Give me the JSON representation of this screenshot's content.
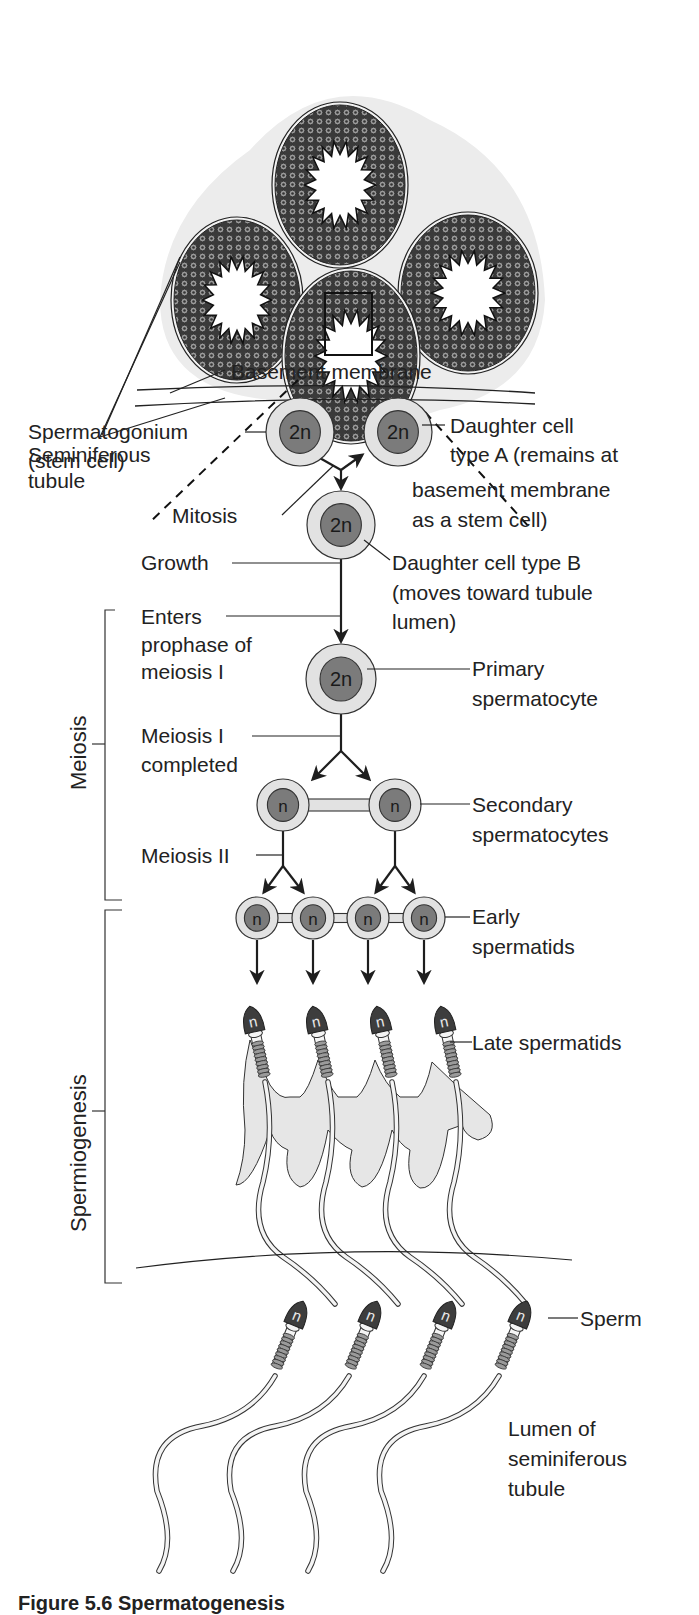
{
  "figure": {
    "caption_partial": "Figure 5.6 Spermatogenesis"
  },
  "colors": {
    "line": "#1e1e1e",
    "cell_outer": "#e2e2e2",
    "cell_nucleus": "#7b7b7b",
    "sperm_head": "#3d3d3d",
    "cytoplasm": "#e6e6e6",
    "tissue_bg": "#ececec",
    "tubule_wall": "#555555"
  },
  "tubules": {
    "label": "Seminiferous tubule",
    "label_lines": [
      "Seminiferous",
      "tubule"
    ],
    "items": [
      {
        "name": "top",
        "cx": 340,
        "cy": 185,
        "rx": 65,
        "ry": 80
      },
      {
        "name": "left",
        "cx": 237,
        "cy": 300,
        "rx": 63,
        "ry": 80
      },
      {
        "name": "right",
        "cx": 468,
        "cy": 293,
        "rx": 67,
        "ry": 78
      },
      {
        "name": "bottom",
        "cx": 351,
        "cy": 356,
        "rx": 66,
        "ry": 85
      }
    ]
  },
  "labels": {
    "basement_membrane": "Basement membrane",
    "spermatogonium": [
      "Spermatogonium",
      "(stem cell)"
    ],
    "daughter_a": [
      "Daughter cell",
      "type A (remains at",
      "basement membrane",
      "as a stem cell)"
    ],
    "mitosis": "Mitosis",
    "growth": "Growth",
    "daughter_b": [
      "Daughter cell type B",
      "(moves toward tubule",
      "lumen)"
    ],
    "enters_prophase": [
      "Enters",
      "prophase of",
      "meiosis I"
    ],
    "primary_spermatocyte": [
      "Primary",
      "spermatocyte"
    ],
    "meiosis_i_completed": [
      "Meiosis I",
      "completed"
    ],
    "secondary_spermatocytes": [
      "Secondary",
      "spermatocytes"
    ],
    "meiosis_ii": "Meiosis II",
    "early_spermatids": [
      "Early",
      "spermatids"
    ],
    "late_spermatids": "Late spermatids",
    "sperm": "Sperm",
    "lumen": [
      "Lumen of",
      "seminiferous",
      "tubule"
    ]
  },
  "phases": {
    "meiosis": "Meiosis",
    "spermiogenesis": "Spermiogenesis"
  },
  "cells": {
    "spermatogonium": {
      "ploidy": "2n",
      "cx": 300,
      "cy": 432,
      "r": 34
    },
    "daughter_a": {
      "ploidy": "2n",
      "cx": 398,
      "cy": 432,
      "r": 34
    },
    "daughter_b": {
      "ploidy": "2n",
      "cx": 341,
      "cy": 525,
      "r": 34
    },
    "primary_spermatocyte": {
      "ploidy": "2n",
      "cx": 341,
      "cy": 679,
      "r": 35
    },
    "secondary_spermatocytes": [
      {
        "ploidy": "n",
        "cx": 283,
        "cy": 805,
        "r": 26
      },
      {
        "ploidy": "n",
        "cx": 395,
        "cy": 805,
        "r": 26
      }
    ],
    "early_spermatids": [
      {
        "ploidy": "n",
        "cx": 257,
        "cy": 918,
        "r": 21
      },
      {
        "ploidy": "n",
        "cx": 313,
        "cy": 918,
        "r": 21
      },
      {
        "ploidy": "n",
        "cx": 368,
        "cy": 918,
        "r": 21
      },
      {
        "ploidy": "n",
        "cx": 424,
        "cy": 918,
        "r": 21
      }
    ],
    "late_spermatids": [
      {
        "ploidy": "n",
        "x": 250
      },
      {
        "ploidy": "n",
        "x": 313
      },
      {
        "ploidy": "n",
        "x": 377
      },
      {
        "ploidy": "n",
        "x": 441
      }
    ],
    "sperm": [
      {
        "ploidy": "n",
        "x": 307
      },
      {
        "ploidy": "n",
        "x": 381
      },
      {
        "ploidy": "n",
        "x": 456
      },
      {
        "ploidy": "n",
        "x": 531
      }
    ]
  }
}
